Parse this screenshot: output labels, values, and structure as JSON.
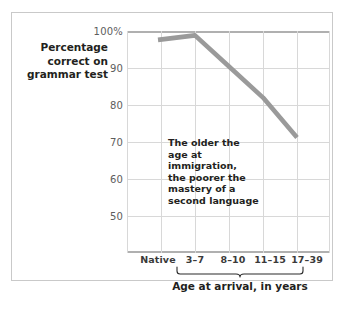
{
  "figure": {
    "annotation": {
      "lines": [
        "The older the",
        "age at immigration,",
        "the poorer the",
        "mastery of a",
        "second language"
      ],
      "text": "The older the age at immigration, the poorer the mastery of a second language"
    },
    "colors": {
      "series_line": "#9a9a9a",
      "gridline": "#d8d8d8",
      "axis_rule": "#b0b0b0",
      "frame": "#c9c9c9",
      "text": "#231f20",
      "tick_text": "#5d5d5d",
      "background": "#ffffff"
    }
  },
  "chart_data": {
    "type": "line",
    "title": "",
    "xlabel": "Age at arrival, in years",
    "ylabel": "Percentage correct on grammar test",
    "ylabel_lines": [
      "Percentage",
      "correct on",
      "grammar test"
    ],
    "categories": [
      "Native",
      "3–7",
      "8–10",
      "11–15",
      "17–39"
    ],
    "values": [
      98,
      99,
      92,
      85,
      76
    ],
    "ylim": [
      50,
      100
    ],
    "yticks": [
      100,
      90,
      80,
      70,
      60,
      50
    ],
    "ytick_labels": [
      "100%",
      "90",
      "80",
      "70",
      "60",
      "50"
    ],
    "grid": true,
    "legend": "none",
    "series": [
      {
        "name": "Percentage correct on grammar test",
        "values": [
          98,
          99,
          92,
          85,
          76
        ]
      }
    ],
    "annotations": [
      {
        "text": "The older the age at immigration, the poorer the mastery of a second language",
        "x": "3–7",
        "y": 79
      }
    ]
  }
}
